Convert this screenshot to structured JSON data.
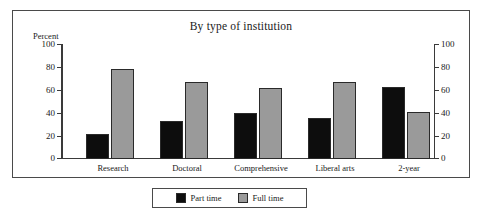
{
  "chart_data": {
    "type": "bar",
    "title": "By type of institution",
    "xlabel": "",
    "ylabel": "Percent",
    "ylim": [
      0,
      100
    ],
    "yticks": [
      0,
      20,
      40,
      60,
      80,
      100
    ],
    "ytick_labels": [
      "0",
      "20",
      "40",
      "60",
      "80",
      "100"
    ],
    "dual_axis": true,
    "right_axis_labels": [
      "0",
      "20",
      "40",
      "60",
      "80",
      "100"
    ],
    "grid": false,
    "legend_position": "bottom-outside",
    "categories": [
      "Research",
      "Doctoral",
      "Comprehensive",
      "Liberal arts",
      "2-year"
    ],
    "series": [
      {
        "name": "Part time",
        "color": "#0d0d0d",
        "values": [
          22,
          33,
          40,
          36,
          63
        ]
      },
      {
        "name": "Full time",
        "color": "#9a9a9a",
        "values": [
          78,
          67,
          62,
          67,
          41
        ]
      }
    ]
  },
  "legend": {
    "items": [
      {
        "label": "Part time",
        "color": "#0d0d0d"
      },
      {
        "label": "Full time",
        "color": "#9a9a9a"
      }
    ]
  }
}
